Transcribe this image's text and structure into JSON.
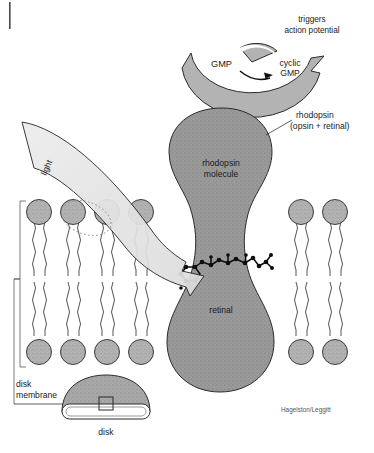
{
  "figure": {
    "credit": "Hagelston/Leggitt"
  },
  "labels": {
    "triggers": "triggers",
    "action_potential": "action potential",
    "gmp": "GMP",
    "cyclic": "cyclic",
    "cyclic_gmp2": "GMP",
    "rhodopsin_callout_1": "rhodopsin",
    "rhodopsin_callout_2": "(opsin + retinal)",
    "rhodopsin_molecule_1": "rhodopsin",
    "rhodopsin_molecule_2": "molecule",
    "retinal": "retinal",
    "light": "light",
    "disk_membrane_1": "disk",
    "disk_membrane_2": "membrane",
    "disk": "disk"
  },
  "colors": {
    "protein_fill": "#9c9c9c",
    "arc_fill": "#b3b3b3",
    "lipid_head": "#b2b2b2",
    "beam_fill": "#e2e2e2",
    "disk_dome": "#a8a8a8",
    "outline": "#2b2b2b",
    "text": "#1a1a1a",
    "credit_text": "#555555"
  },
  "icons": {
    "arc_arrow": "curved-arrow-icon",
    "light_beam": "light-beam-arrow-icon",
    "retinal_molecule": "molecule-ball-stick-icon",
    "bracket": "bracket-icon",
    "disk": "disk-icon",
    "scan_tick": "scan-mark-icon"
  }
}
